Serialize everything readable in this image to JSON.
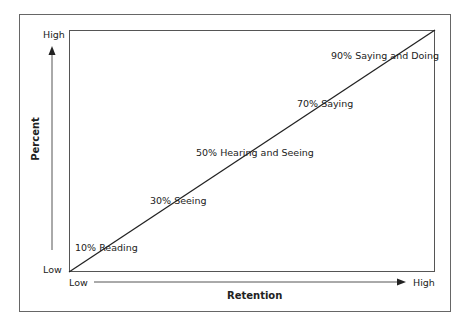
{
  "diagram": {
    "type": "retention-line",
    "y_axis": {
      "title": "Percent",
      "high_label": "High",
      "low_label": "Low"
    },
    "x_axis": {
      "title": "Retention",
      "low_label": "Low",
      "high_label": "High"
    },
    "points": [
      {
        "label": "10% Reading"
      },
      {
        "label": "30% Seeing"
      },
      {
        "label": "50% Hearing and Seeing"
      },
      {
        "label": "70% Saying"
      },
      {
        "label": "90% Saying and Doing"
      }
    ],
    "colors": {
      "line": "#222222",
      "frame": "#666666",
      "background": "#ffffff"
    }
  }
}
